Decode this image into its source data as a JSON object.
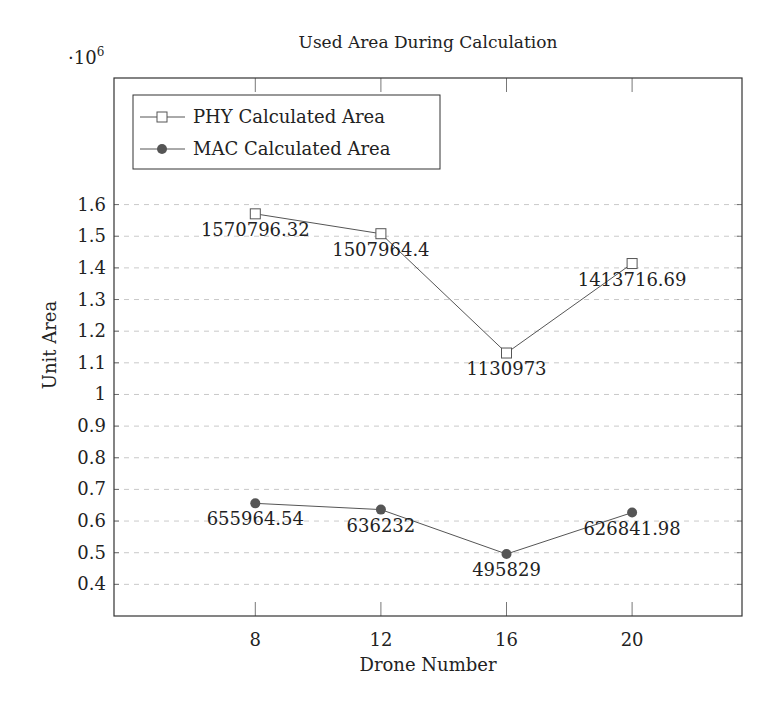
{
  "chart_data": {
    "type": "line",
    "title": "Used Area During Calculation",
    "xlabel": "Drone Number",
    "ylabel": "Unit Area",
    "y_scale_label": "·10^6",
    "y_scale_base": "·10",
    "y_scale_exp": "6",
    "x": [
      8,
      12,
      16,
      20
    ],
    "x_ticks": [
      "8",
      "12",
      "16",
      "20"
    ],
    "xlim": [
      3.5,
      23.5
    ],
    "y_ticks": [
      "0.4",
      "0.5",
      "0.6",
      "0.7",
      "0.8",
      "0.9",
      "1",
      "1.1",
      "1.2",
      "1.3",
      "1.4",
      "1.5",
      "1.6"
    ],
    "y_tick_values": [
      0.4,
      0.5,
      0.6,
      0.7,
      0.8,
      0.9,
      1.0,
      1.1,
      1.2,
      1.3,
      1.4,
      1.5,
      1.6
    ],
    "ylim": [
      0.3,
      2.0
    ],
    "grid": "horizontal dashed",
    "legend_position": "upper left",
    "series": [
      {
        "name": "PHY Calculated Area",
        "marker": "open-square",
        "values": [
          1570796.32,
          1507964.4,
          1130973,
          1413716.69
        ],
        "labels": [
          "1570796.32",
          "1507964.4",
          "1130973",
          "1413716.69"
        ]
      },
      {
        "name": "MAC Calculated Area",
        "marker": "filled-circle",
        "values": [
          655964.54,
          636232,
          495829,
          626841.98
        ],
        "labels": [
          "655964.54",
          "636232",
          "495829",
          "626841.98"
        ]
      }
    ]
  },
  "colors": {
    "line": "#555555",
    "marker_fill": "#555555",
    "frame": "#333333",
    "grid": "#bbbbbb",
    "text": "#222222"
  }
}
